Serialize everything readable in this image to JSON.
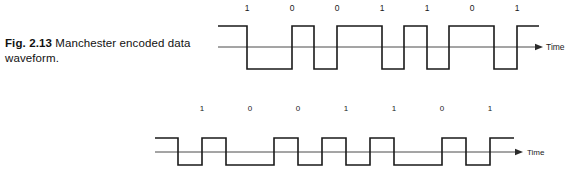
{
  "figure": {
    "label": "Fig. 2.13",
    "text": " Manchester encoded data waveform."
  },
  "colors": {
    "wave": "#1a1a1a",
    "axis": "#4a4a4a",
    "background": "#ffffff",
    "text": "#1a1a1a"
  },
  "waveforms": [
    {
      "id": "top",
      "name": "manchester-waveform-top",
      "bits": [
        "1",
        "0",
        "0",
        "1",
        "1",
        "0",
        "1"
      ],
      "axis_caption": "Time",
      "bit_label_y": 11,
      "bit_label_font_size": 8.5,
      "bit_label_x": [
        247,
        292,
        337,
        382,
        427,
        472,
        517
      ],
      "axis": {
        "y": 47,
        "x_start": 218,
        "x_end": 535,
        "arrow_tip_x": 543,
        "caption_x": 546,
        "caption_y": 50,
        "caption_font_size": 8.5,
        "stroke_width": 1
      },
      "wave": {
        "high_y": 26,
        "low_y": 69,
        "stroke_width": 1.6,
        "x_start": 218,
        "bit_width": 45,
        "lead_in": 7,
        "tail": 7,
        "points": [
          [
            218,
            26
          ],
          [
            247,
            26
          ],
          [
            247,
            69
          ],
          [
            292,
            69
          ],
          [
            292,
            26
          ],
          [
            314,
            26
          ],
          [
            314,
            69
          ],
          [
            337,
            69
          ],
          [
            337,
            26
          ],
          [
            382,
            26
          ],
          [
            382,
            69
          ],
          [
            404,
            69
          ],
          [
            404,
            26
          ],
          [
            427,
            26
          ],
          [
            427,
            69
          ],
          [
            449,
            69
          ],
          [
            449,
            26
          ],
          [
            494,
            26
          ],
          [
            494,
            69
          ],
          [
            517,
            69
          ],
          [
            517,
            26
          ],
          [
            539,
            26
          ]
        ]
      }
    },
    {
      "id": "bottom",
      "name": "manchester-waveform-bottom",
      "bits": [
        "1",
        "0",
        "0",
        "1",
        "1",
        "0",
        "1"
      ],
      "axis_caption": "Time",
      "bit_label_y": 25,
      "bit_label_font_size": 8,
      "bit_label_x": [
        202,
        250,
        298,
        346,
        394,
        442,
        490
      ],
      "axis": {
        "y": 66,
        "x_start": 155,
        "x_end": 515,
        "arrow_tip_x": 523,
        "caption_x": 527,
        "caption_y": 69,
        "caption_font_size": 8,
        "stroke_width": 1
      },
      "wave": {
        "high_y": 52,
        "low_y": 79,
        "stroke_width": 1.6,
        "x_start": 155,
        "bit_width": 48,
        "lead_in": 8,
        "tail": 8,
        "points": [
          [
            155,
            52
          ],
          [
            178,
            52
          ],
          [
            178,
            79
          ],
          [
            202,
            79
          ],
          [
            202,
            52
          ],
          [
            226,
            52
          ],
          [
            226,
            79
          ],
          [
            274,
            79
          ],
          [
            274,
            52
          ],
          [
            298,
            52
          ],
          [
            298,
            79
          ],
          [
            322,
            79
          ],
          [
            322,
            52
          ],
          [
            346,
            52
          ],
          [
            346,
            79
          ],
          [
            370,
            79
          ],
          [
            370,
            52
          ],
          [
            394,
            52
          ],
          [
            394,
            79
          ],
          [
            442,
            79
          ],
          [
            442,
            52
          ],
          [
            466,
            52
          ],
          [
            466,
            79
          ],
          [
            490,
            79
          ],
          [
            490,
            52
          ],
          [
            514,
            52
          ]
        ]
      }
    }
  ]
}
